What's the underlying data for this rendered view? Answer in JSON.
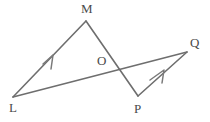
{
  "figure": {
    "background_color": "#ffffff",
    "line_color": "#6e6e6e",
    "label_color": "#4a4a4a",
    "points": {
      "L": {
        "label": "L",
        "x": 13,
        "y": 97,
        "label_x": 9,
        "label_y": 109
      },
      "M": {
        "label": "M",
        "x": 86,
        "y": 21,
        "label_x": 81,
        "label_y": 10
      },
      "O": {
        "label": "O",
        "x": 113,
        "y": 68,
        "label_x": 97,
        "label_y": 62
      },
      "P": {
        "label": "P",
        "x": 138,
        "y": 96,
        "label_x": 134,
        "label_y": 110
      },
      "Q": {
        "label": "Q",
        "x": 187,
        "y": 52,
        "label_x": 190,
        "label_y": 44
      }
    },
    "segments": [
      {
        "name": "segment-LM",
        "from": "L",
        "to": "M",
        "d": "M 13 97 L 86 21"
      },
      {
        "name": "segment-MP",
        "from": "M",
        "to": "P",
        "d": "M 86 21 L 138 96"
      },
      {
        "name": "segment-LQ",
        "from": "L",
        "to": "Q",
        "d": "M 13 97 L 187 52"
      },
      {
        "name": "segment-PQ",
        "from": "P",
        "to": "Q",
        "d": "M 138 96 L 187 52"
      }
    ],
    "parallel_marks": [
      {
        "name": "parallel-mark-lm",
        "on": "segment-LM",
        "d": "M 43 64 L 53 55 L 51 69"
      },
      {
        "name": "parallel-mark-pq",
        "on": "segment-PQ",
        "d": "M 150 80 L 164 70 L 162 83"
      }
    ],
    "labels_order": [
      "M",
      "O",
      "Q",
      "L",
      "P"
    ]
  }
}
